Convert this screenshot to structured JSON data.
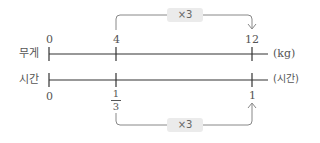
{
  "diagram": {
    "type": "double-number-line",
    "rows": [
      {
        "label": "무게",
        "unit": "(kg)",
        "ticks": [
          {
            "position": "start",
            "value": "0"
          },
          {
            "position": "mid",
            "value": "4"
          },
          {
            "position": "end",
            "value": "12"
          }
        ]
      },
      {
        "label": "시간",
        "unit": "(시간)",
        "ticks": [
          {
            "position": "start",
            "value": "0"
          },
          {
            "position": "mid",
            "value": "1/3",
            "numerator": "1",
            "denominator": "3"
          },
          {
            "position": "end",
            "value": "1"
          }
        ]
      }
    ],
    "arrows": [
      {
        "from": "4",
        "to": "12",
        "row": "무게",
        "label": "×3",
        "placement": "above"
      },
      {
        "from": "1/3",
        "to": "1",
        "row": "시간",
        "label": "×3",
        "placement": "below"
      }
    ]
  },
  "colors": {
    "line": "#333333",
    "arrow": "#888888",
    "badge_bg": "#ebebeb",
    "text": "#555555"
  }
}
